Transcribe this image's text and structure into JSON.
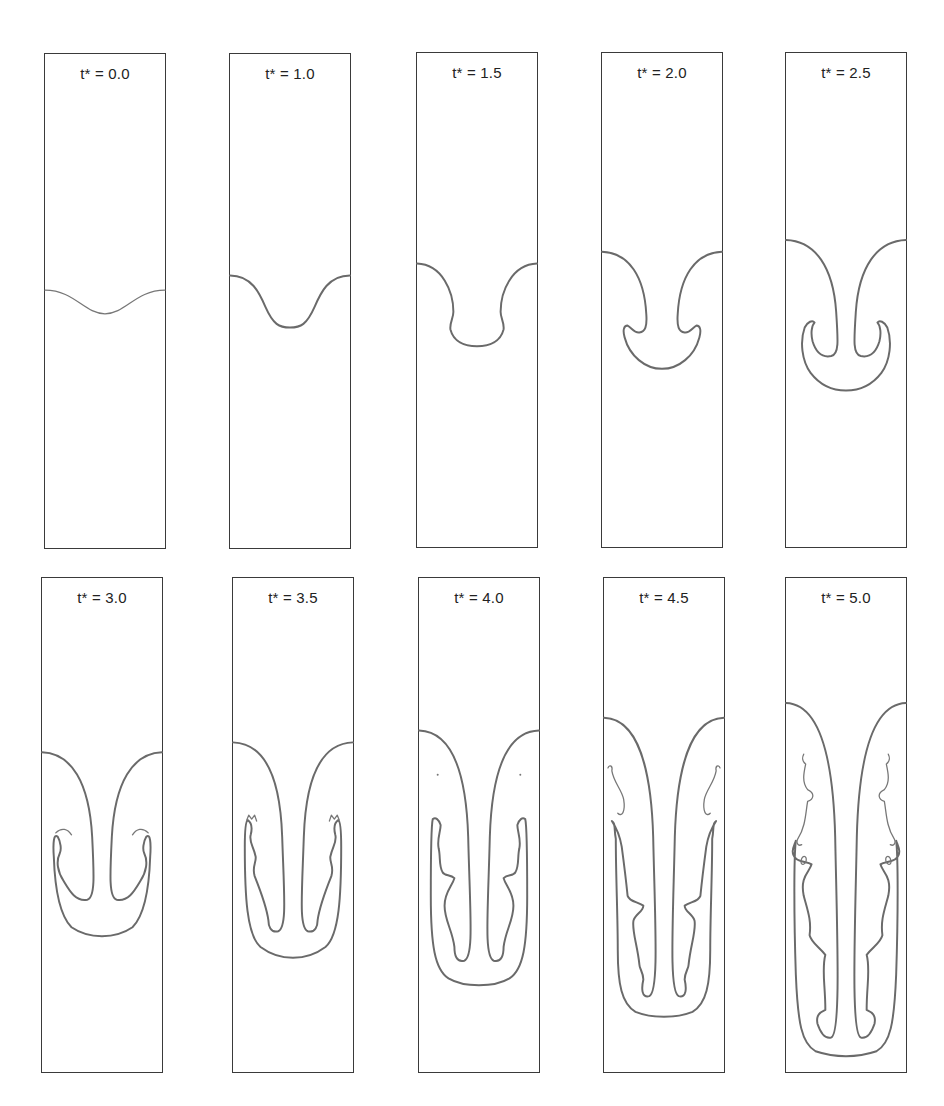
{
  "figure": {
    "panels": [
      {
        "label": "t* = 0.0"
      },
      {
        "label": "t* = 1.0"
      },
      {
        "label": "t* = 1.5"
      },
      {
        "label": "t* = 2.0"
      },
      {
        "label": "t* = 2.5"
      },
      {
        "label": "t* = 3.0"
      },
      {
        "label": "t* = 3.5"
      },
      {
        "label": "t* = 4.0"
      },
      {
        "label": "t* = 4.5"
      },
      {
        "label": "t* = 5.0"
      }
    ],
    "layout": {
      "rows": 2,
      "columns": 5
    },
    "colors": {
      "frame": "#3a3a3a",
      "interface": "#6a6a6a",
      "background": "#ffffff"
    }
  }
}
